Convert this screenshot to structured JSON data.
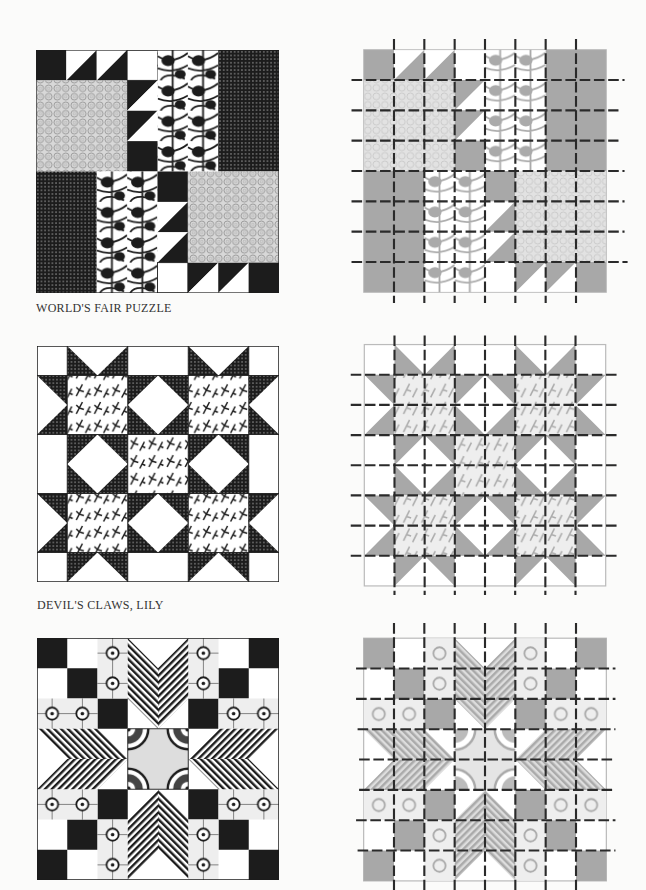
{
  "page": {
    "background": "#fbfbfa",
    "dark_color": "#1c1c1c",
    "gray_color": "#a8a8a8",
    "light_gray": "#e2e2e2"
  },
  "blocks": [
    {
      "name": "WORLD'S FAIR PUZZLE",
      "caption": "WORLD'S FAIR PUZZLE",
      "grid": "8x8",
      "style": "finished",
      "diagram_style": "gray with dashed cutting grid"
    },
    {
      "name": "DEVIL'S CLAWS, LILY",
      "caption": "DEVIL'S CLAWS, LILY",
      "grid": "8x8",
      "style": "finished",
      "diagram_style": "gray with dashed cutting grid"
    },
    {
      "name": "Eight-point star block",
      "caption": "",
      "grid": "8x8",
      "style": "finished",
      "diagram_style": "gray with dashed cutting grid"
    }
  ]
}
